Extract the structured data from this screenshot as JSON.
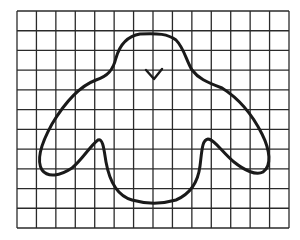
{
  "figure": {
    "grid": {
      "columns": 14,
      "rows": 11,
      "left": 17,
      "top": 11,
      "right": 289,
      "bottom": 228,
      "line_color": "#2a2a2a"
    },
    "outline_color": "#1a1a1a",
    "background": "#ffffff"
  }
}
